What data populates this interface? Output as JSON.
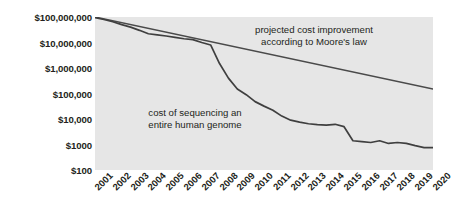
{
  "chart_data": {
    "type": "line",
    "title": "",
    "xlabel": "",
    "ylabel": "",
    "yscale": "log",
    "ylim": [
      100,
      100000000
    ],
    "xlim": [
      2001,
      2020
    ],
    "grid": false,
    "legend": "none",
    "y_tick_labels": [
      "$100,000,000",
      "$10,000,000",
      "$1,000,000",
      "$100,000",
      "$10,000",
      "$1000",
      "$100"
    ],
    "y_tick_values": [
      100000000,
      10000000,
      1000000,
      100000,
      10000,
      1000,
      100
    ],
    "categories": [
      2001,
      2002,
      2003,
      2004,
      2005,
      2006,
      2007,
      2008,
      2009,
      2010,
      2011,
      2012,
      2013,
      2014,
      2015,
      2016,
      2017,
      2018,
      2019,
      2020
    ],
    "x_tick_labels": [
      "2001",
      "2002",
      "2003",
      "2004",
      "2005",
      "2006",
      "2007",
      "2008",
      "2009",
      "2010",
      "2011",
      "2012",
      "2013",
      "2014",
      "2015",
      "2016",
      "2017",
      "2018",
      "2019",
      "2020"
    ],
    "series": [
      {
        "name": "cost of sequencing an entire human genome",
        "color": "#3f3f3f",
        "x": [
          2001,
          2001.5,
          2002,
          2002.5,
          2003,
          2003.5,
          2004,
          2004.5,
          2005,
          2005.5,
          2006,
          2006.5,
          2007,
          2007.5,
          2008,
          2008.5,
          2009,
          2009.5,
          2010,
          2010.5,
          2011,
          2011.5,
          2012,
          2012.5,
          2013,
          2013.5,
          2014,
          2014.5,
          2015,
          2015.5,
          2016,
          2016.5,
          2017,
          2017.5,
          2018,
          2018.5,
          2019,
          2019.5,
          2020
        ],
        "values": [
          95000000,
          80000000,
          65000000,
          50000000,
          40000000,
          30000000,
          22000000,
          20000000,
          18000000,
          16000000,
          14000000,
          13000000,
          10000000,
          8000000,
          1500000,
          400000,
          150000,
          90000,
          48000,
          32000,
          22000,
          13000,
          9000,
          7500,
          6500,
          6000,
          5800,
          6200,
          5000,
          1400,
          1300,
          1200,
          1400,
          1100,
          1200,
          1100,
          900,
          750,
          760
        ]
      },
      {
        "name": "projected cost improvement according to Moore's law",
        "color": "#4a4a4a",
        "x": [
          2001,
          2020
        ],
        "values": [
          100000000,
          150000
        ]
      }
    ],
    "annotations": [
      {
        "id": "moores-law",
        "text": "projected cost improvement\naccording to Moore's law"
      },
      {
        "id": "genome-cost",
        "text": "cost of sequencing an\nentire human genome"
      }
    ],
    "colors": {
      "plot_background": "#e6e6e6",
      "page_background": "#ffffff",
      "text": "#231f20",
      "cost_line": "#3f3f3f",
      "moores_line": "#4a4a4a"
    }
  }
}
